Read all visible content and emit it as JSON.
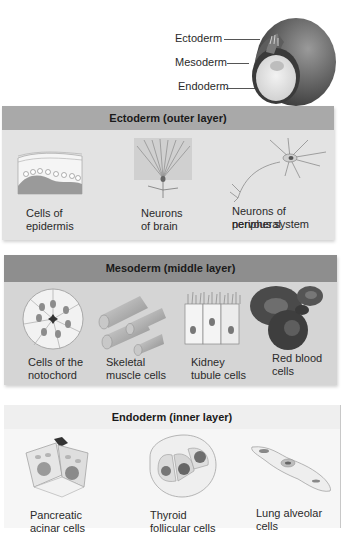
{
  "embryo": {
    "labels": [
      "Ectoderm",
      "Mesoderm",
      "Endoderm"
    ]
  },
  "panels": [
    {
      "title": "Ectoderm (outer layer)",
      "color": "#a9a9a9",
      "items": [
        {
          "line1": "Cells of",
          "line2": "epidermis"
        },
        {
          "line1": "Neurons",
          "line2": "of brain"
        },
        {
          "line1": "Neurons of peripheral",
          "line2": "nervous system"
        }
      ]
    },
    {
      "title": "Mesoderm (middle layer)",
      "color": "#8e8e8e",
      "items": [
        {
          "line1": "Cells of the",
          "line2": "notochord"
        },
        {
          "line1": "Skeletal",
          "line2": "muscle cells"
        },
        {
          "line1": "Kidney",
          "line2": "tubule cells"
        },
        {
          "line1": "Red blood",
          "line2": "cells"
        }
      ]
    },
    {
      "title": "Endoderm (inner layer)",
      "color": "#efefef",
      "items": [
        {
          "line1": "Pancreatic",
          "line2": "acinar cells"
        },
        {
          "line1": "Thyroid",
          "line2": "follicular cells"
        },
        {
          "line1": "Lung alveolar",
          "line2": "cells"
        }
      ]
    }
  ]
}
